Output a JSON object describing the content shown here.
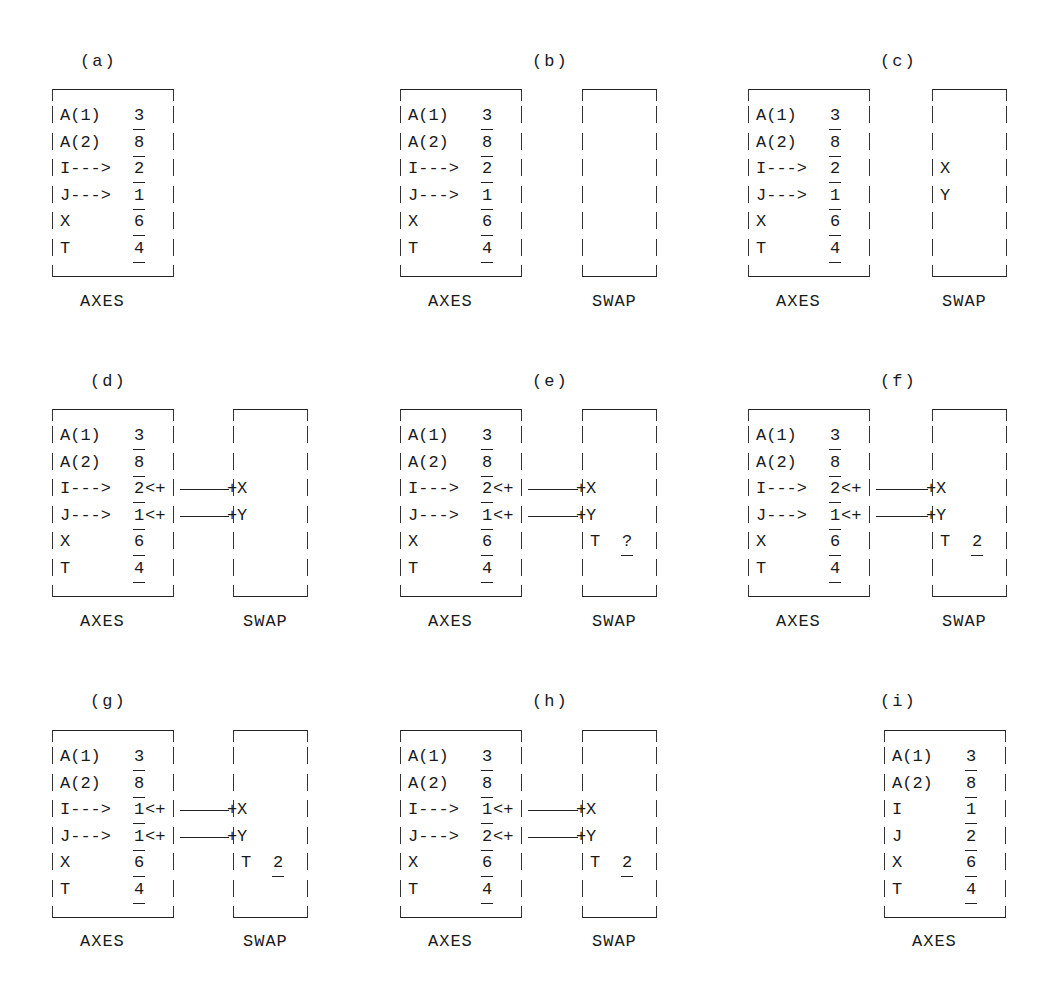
{
  "figure": {
    "row_height": 26.6,
    "axes_rows": [
      "A(1)",
      "A(2)",
      "I",
      "J",
      "X",
      "T"
    ],
    "panels": [
      {
        "id": "a",
        "label": "(a)",
        "axes": {
          "caption": "AXES",
          "names": [
            "A(1)",
            "A(2)",
            "I--->",
            "J--->",
            "X",
            "T"
          ],
          "values": [
            "3",
            "8",
            "2",
            "1",
            "6",
            "4"
          ]
        },
        "swap": null
      },
      {
        "id": "b",
        "label": "(b)",
        "axes": {
          "caption": "AXES",
          "names": [
            "A(1)",
            "A(2)",
            "I--->",
            "J--->",
            "X",
            "T"
          ],
          "values": [
            "3",
            "8",
            "2",
            "1",
            "6",
            "4"
          ]
        },
        "swap": {
          "caption": "SWAP",
          "entries": [],
          "links": false
        }
      },
      {
        "id": "c",
        "label": "(c)",
        "axes": {
          "caption": "AXES",
          "names": [
            "A(1)",
            "A(2)",
            "I--->",
            "J--->",
            "X",
            "T"
          ],
          "values": [
            "3",
            "8",
            "2",
            "1",
            "6",
            "4"
          ]
        },
        "swap": {
          "caption": "SWAP",
          "entries": [
            {
              "row": 2,
              "name": "X",
              "value": ""
            },
            {
              "row": 3,
              "name": "Y",
              "value": ""
            }
          ],
          "links": false
        }
      },
      {
        "id": "d",
        "label": "(d)",
        "axes": {
          "caption": "AXES",
          "names": [
            "A(1)",
            "A(2)",
            "I--->",
            "J--->",
            "X",
            "T"
          ],
          "values": [
            "3",
            "8",
            "2",
            "1",
            "6",
            "4"
          ]
        },
        "swap": {
          "caption": "SWAP",
          "entries": [
            {
              "row": 2,
              "name": "X",
              "value": ""
            },
            {
              "row": 3,
              "name": "Y",
              "value": ""
            }
          ],
          "links": true
        }
      },
      {
        "id": "e",
        "label": "(e)",
        "axes": {
          "caption": "AXES",
          "names": [
            "A(1)",
            "A(2)",
            "I--->",
            "J--->",
            "X",
            "T"
          ],
          "values": [
            "3",
            "8",
            "2",
            "1",
            "6",
            "4"
          ]
        },
        "swap": {
          "caption": "SWAP",
          "entries": [
            {
              "row": 2,
              "name": "X",
              "value": ""
            },
            {
              "row": 3,
              "name": "Y",
              "value": ""
            },
            {
              "row": 4,
              "name": "T",
              "value": "?"
            }
          ],
          "links": true
        }
      },
      {
        "id": "f",
        "label": "(f)",
        "axes": {
          "caption": "AXES",
          "names": [
            "A(1)",
            "A(2)",
            "I--->",
            "J--->",
            "X",
            "T"
          ],
          "values": [
            "3",
            "8",
            "2",
            "1",
            "6",
            "4"
          ]
        },
        "swap": {
          "caption": "SWAP",
          "entries": [
            {
              "row": 2,
              "name": "X",
              "value": ""
            },
            {
              "row": 3,
              "name": "Y",
              "value": ""
            },
            {
              "row": 4,
              "name": "T",
              "value": "2"
            }
          ],
          "links": true
        }
      },
      {
        "id": "g",
        "label": "(g)",
        "axes": {
          "caption": "AXES",
          "names": [
            "A(1)",
            "A(2)",
            "I--->",
            "J--->",
            "X",
            "T"
          ],
          "values": [
            "3",
            "8",
            "1",
            "1",
            "6",
            "4"
          ]
        },
        "swap": {
          "caption": "SWAP",
          "entries": [
            {
              "row": 2,
              "name": "X",
              "value": ""
            },
            {
              "row": 3,
              "name": "Y",
              "value": ""
            },
            {
              "row": 4,
              "name": "T",
              "value": "2"
            }
          ],
          "links": true
        }
      },
      {
        "id": "h",
        "label": "(h)",
        "axes": {
          "caption": "AXES",
          "names": [
            "A(1)",
            "A(2)",
            "I--->",
            "J--->",
            "X",
            "T"
          ],
          "values": [
            "3",
            "8",
            "1",
            "2",
            "6",
            "4"
          ]
        },
        "swap": {
          "caption": "SWAP",
          "entries": [
            {
              "row": 2,
              "name": "X",
              "value": ""
            },
            {
              "row": 3,
              "name": "Y",
              "value": ""
            },
            {
              "row": 4,
              "name": "T",
              "value": "2"
            }
          ],
          "links": true
        }
      },
      {
        "id": "i",
        "label": "(i)",
        "axes": {
          "caption": "AXES",
          "names": [
            "A(1)",
            "A(2)",
            "I",
            "J",
            "X",
            "T"
          ],
          "values": [
            "3",
            "8",
            "1",
            "2",
            "6",
            "4"
          ]
        },
        "swap": null
      }
    ]
  }
}
